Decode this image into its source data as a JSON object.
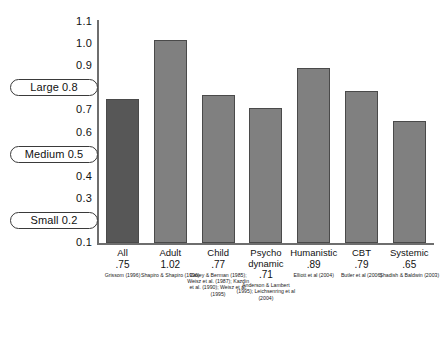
{
  "chart_data": {
    "type": "bar",
    "title": "",
    "subtitle": "",
    "xlabel": "",
    "ylabel": "",
    "ylim": [
      0.1,
      1.1
    ],
    "grid": false,
    "legend": "none",
    "categories": [
      "All",
      "Adult",
      "Child",
      "Psycho dynamic",
      "Humanistic",
      "CBT",
      "Systemic"
    ],
    "values": [
      0.75,
      1.02,
      0.77,
      0.71,
      0.89,
      0.79,
      0.65
    ],
    "value_labels": [
      ".75",
      "1.02",
      ".77",
      ".71",
      ".71",
      ".79",
      ".65"
    ],
    "y_ticks": [
      "1.1",
      "1.0",
      "0.9",
      "0.8",
      "0.7",
      "0.6",
      "0.5",
      "0.4",
      "0.3",
      "0.2",
      "0.1"
    ],
    "benchmarks": [
      {
        "label": "Large 0.8",
        "value": 0.8
      },
      {
        "label": "Medium 0.5",
        "value": 0.5
      },
      {
        "label": "Small 0.2",
        "value": 0.2
      }
    ],
    "bar_colors": [
      "#575757",
      "#808080",
      "#808080",
      "#808080",
      "#808080",
      "#808080",
      "#808080"
    ]
  },
  "axis": {
    "ticks": [
      {
        "label": "1.1",
        "value": 1.1
      },
      {
        "label": "1.0",
        "value": 1.0
      },
      {
        "label": "0.9",
        "value": 0.9
      },
      {
        "label": "0.8",
        "value": 0.8
      },
      {
        "label": "0.7",
        "value": 0.7
      },
      {
        "label": "0.6",
        "value": 0.6
      },
      {
        "label": "0.5",
        "value": 0.5
      },
      {
        "label": "0.4",
        "value": 0.4
      },
      {
        "label": "0.3",
        "value": 0.3
      },
      {
        "label": "0.2",
        "value": 0.2
      },
      {
        "label": "0.1",
        "value": 0.1
      }
    ]
  },
  "benchmark_pills": [
    {
      "label": "Large 0.8",
      "value": 0.8
    },
    {
      "label": "Medium 0.5",
      "value": 0.5
    },
    {
      "label": "Small 0.2",
      "value": 0.2
    }
  ],
  "bars": [
    {
      "name": "All",
      "name_line2": "",
      "value_label": ".75",
      "value": 0.75,
      "citation": "Grissom (1996)",
      "color": "#575757"
    },
    {
      "name": "Adult",
      "name_line2": "",
      "value_label": "1.02",
      "value": 1.02,
      "citation": "Shapiro & Shapiro (1996)",
      "color": "#808080"
    },
    {
      "name": "Child",
      "name_line2": "",
      "value_label": ".77",
      "value": 0.77,
      "citation": "Casey & Berman (1985); Weisz et al. (1987); Kazdin et al. (1990); Weisz et al. (1995)",
      "color": "#808080"
    },
    {
      "name": "Psycho",
      "name_line2": "dynamic",
      "value_label": ".71",
      "value": 0.71,
      "citation": "Anderson & Lambert (1995); Leichsenring et al (2004)",
      "color": "#808080"
    },
    {
      "name": "Humanistic",
      "name_line2": "",
      "value_label": ".89",
      "value": 0.89,
      "citation": "Elliott et al (2004)",
      "color": "#808080"
    },
    {
      "name": "CBT",
      "name_line2": "",
      "value_label": ".79",
      "value": 0.79,
      "citation": "Butler et al (2006)",
      "color": "#808080"
    },
    {
      "name": "Systemic",
      "name_line2": "",
      "value_label": ".65",
      "value": 0.65,
      "citation": "Shadish & Baldwin (2003)",
      "color": "#808080"
    }
  ]
}
